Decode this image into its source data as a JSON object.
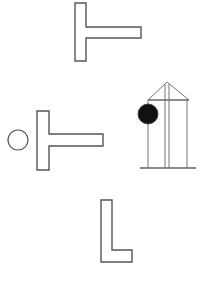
{
  "figure": {
    "stroke_color": "#555555",
    "fill_color": "#ffffff",
    "ball_color": "#111111",
    "elements": [
      {
        "id": "top-t-shape",
        "type": "T-shape outline"
      },
      {
        "id": "hollow-circle",
        "type": "circle outline"
      },
      {
        "id": "middle-t-shape",
        "type": "T-shape outline"
      },
      {
        "id": "pendulum-stand",
        "type": "frame with triangular top"
      },
      {
        "id": "pendulum-ball",
        "type": "filled black circle"
      },
      {
        "id": "l-shape",
        "type": "L-shape outline"
      }
    ]
  }
}
